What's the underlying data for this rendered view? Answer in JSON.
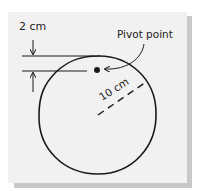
{
  "diagram": {
    "labels": {
      "gap": "2 cm",
      "pivot": "Pivot point",
      "radius": "10 cm"
    },
    "colors": {
      "card": "#f1f1f1",
      "shadow": "#c8c8c8",
      "ink": "#1a1a1a"
    },
    "circle": {
      "cx": 97,
      "cy": 115,
      "r": 59
    },
    "pivot_point": {
      "x": 97,
      "y": 70
    }
  }
}
